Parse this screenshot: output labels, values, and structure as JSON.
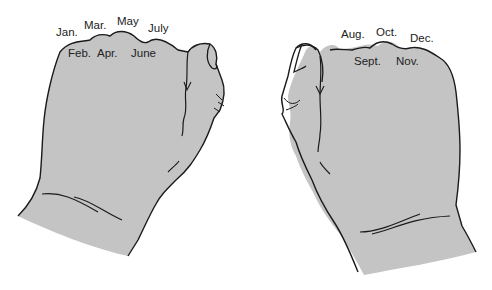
{
  "figure": {
    "colors": {
      "hand_fill": "#c4c4c4",
      "outline": "#1a1a1a",
      "text": "#222222",
      "background": "#ffffff"
    }
  },
  "left_hand": {
    "knuckle_months": [
      {
        "label": "Jan.",
        "x": 56,
        "y": 27
      },
      {
        "label": "Mar.",
        "x": 84,
        "y": 20
      },
      {
        "label": "May",
        "x": 117,
        "y": 16
      },
      {
        "label": "July",
        "x": 148,
        "y": 23
      }
    ],
    "valley_months": [
      {
        "label": "Feb.",
        "x": 68,
        "y": 48
      },
      {
        "label": "Apr.",
        "x": 97,
        "y": 48
      },
      {
        "label": "June",
        "x": 131,
        "y": 48
      }
    ]
  },
  "right_hand": {
    "knuckle_months": [
      {
        "label": "Aug.",
        "x": 341,
        "y": 29
      },
      {
        "label": "Oct.",
        "x": 376,
        "y": 27
      },
      {
        "label": "Dec.",
        "x": 410,
        "y": 33
      }
    ],
    "valley_months": [
      {
        "label": "Sept.",
        "x": 354,
        "y": 56
      },
      {
        "label": "Nov.",
        "x": 396,
        "y": 56
      }
    ]
  }
}
